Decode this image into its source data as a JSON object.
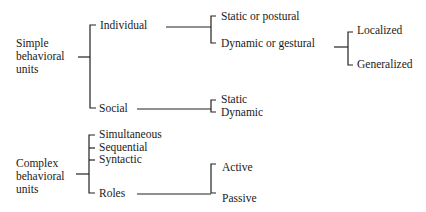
{
  "diagram": {
    "simple": {
      "root": [
        "Simple",
        "behavioral",
        "units"
      ],
      "individual": {
        "label": "Individual",
        "children": [
          "Static or postural",
          "Dynamic or gestural"
        ],
        "gestural_children": [
          "Localized",
          "Generalized"
        ]
      },
      "social": {
        "label": "Social",
        "children": [
          "Static",
          "Dynamic"
        ]
      }
    },
    "complex": {
      "root": [
        "Complex",
        "behavioral",
        "units"
      ],
      "children": [
        "Simultaneous",
        "Sequential",
        "Syntactic",
        "Roles"
      ],
      "roles_children": [
        "Active",
        "Passive"
      ]
    }
  }
}
